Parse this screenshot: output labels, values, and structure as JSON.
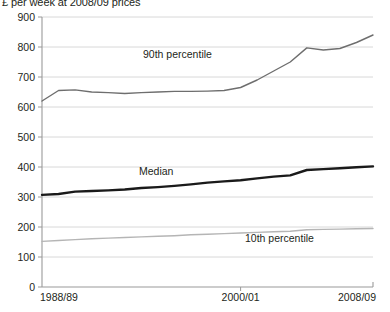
{
  "chart_title": "£ per week at 2008/09 prices",
  "footnote": "",
  "chart_data": {
    "type": "line",
    "title": "£ per week at 2008/09 prices",
    "xlabel": "",
    "ylabel": "£ per week at 2008/09 prices",
    "ylim": [
      0,
      900
    ],
    "ytick_values": [
      0,
      100,
      200,
      300,
      400,
      500,
      600,
      700,
      800,
      900
    ],
    "ytick_labels": [
      "0",
      "100",
      "200",
      "300",
      "400",
      "500",
      "600",
      "700",
      "800",
      "900"
    ],
    "grid": true,
    "legend_position": "inline-annotations",
    "x": [
      "1988/89",
      "1989/90",
      "1990/91",
      "1991/92",
      "1992/93",
      "1993/94",
      "1994/95",
      "1995/96",
      "1996/97",
      "1997/98",
      "1998/99",
      "1999/00",
      "2000/01",
      "2001/02",
      "2002/03",
      "2003/04",
      "2004/05",
      "2005/06",
      "2006/07",
      "2007/08",
      "2008/09"
    ],
    "xtick_labels": [
      "1988/89",
      "2000/01",
      "2008/09"
    ],
    "xtick_positions": [
      0,
      12,
      20
    ],
    "series": [
      {
        "name": "90th percentile",
        "color": "#6e6e6e",
        "width": 1.4,
        "values": [
          620,
          655,
          657,
          650,
          648,
          645,
          648,
          650,
          652,
          652,
          653,
          655,
          665,
          690,
          720,
          750,
          797,
          790,
          795,
          815,
          840
        ]
      },
      {
        "name": "Median",
        "color": "#1a1a1a",
        "width": 2.4,
        "values": [
          307,
          310,
          318,
          320,
          322,
          325,
          330,
          333,
          337,
          342,
          348,
          352,
          356,
          362,
          368,
          372,
          390,
          393,
          396,
          399,
          402
        ]
      },
      {
        "name": "10th percentile",
        "color": "#b5b5b5",
        "width": 1.4,
        "values": [
          152,
          155,
          158,
          161,
          163,
          165,
          167,
          169,
          171,
          174,
          176,
          178,
          180,
          182,
          184,
          186,
          191,
          192,
          193,
          194,
          195
        ]
      }
    ],
    "annotations": [
      {
        "text": "90th percentile",
        "series": "90th percentile",
        "x_px": 143,
        "y_px": 58
      },
      {
        "text": "Median",
        "series": "Median",
        "x_px": 139,
        "y_px": 175
      },
      {
        "text": "10th percentile",
        "series": "10th percentile",
        "x_px": 245,
        "y_px": 242
      }
    ]
  }
}
